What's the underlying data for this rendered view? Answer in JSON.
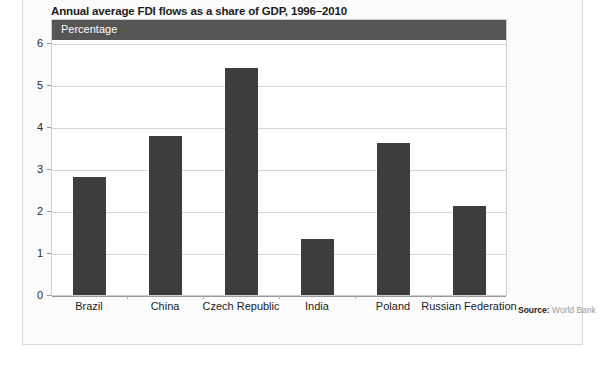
{
  "figure": {
    "title": "Annual average FDI flows as a share of GDP, 1996–2010",
    "unit_banner": "Percentage",
    "source_label": "Source:",
    "source_value": "World Bank",
    "colors": {
      "bar": "#3d3d3d",
      "banner": "#555555",
      "gridline": "#d6d6d6",
      "baseline": "#9a9a9a",
      "frame": "#cfcfcf",
      "title_text": "#1c1c1c",
      "banner_text": "#ffffff",
      "source_value_text": "#9a9a9a"
    }
  },
  "chart_data": {
    "type": "bar",
    "title": "Annual average FDI flows as a share of GDP, 1996–2010",
    "xlabel": "",
    "ylabel": "Percentage",
    "categories": [
      "Brazil",
      "China",
      "Czech Republic",
      "India",
      "Poland",
      "Russian Federation"
    ],
    "values": [
      2.8,
      3.78,
      5.4,
      1.33,
      3.63,
      2.12
    ],
    "ylim": [
      0,
      6
    ],
    "yticks": [
      0,
      1,
      2,
      3,
      4,
      5,
      6
    ],
    "ytick_labels": [
      "0",
      "1",
      "2",
      "3",
      "4",
      "5",
      "6"
    ],
    "grid": true,
    "legend": false,
    "legend_position": "none",
    "series": [
      {
        "name": "Annual average FDI inflows (% of GDP)",
        "values": [
          2.8,
          3.78,
          5.4,
          1.33,
          3.63,
          2.12
        ]
      }
    ]
  }
}
